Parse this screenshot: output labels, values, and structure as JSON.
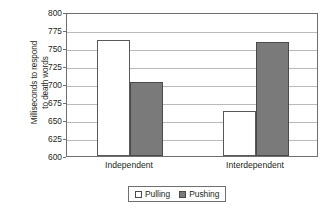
{
  "chart_data": {
    "type": "bar",
    "title": "",
    "xlabel": "",
    "ylabel": "Milliseconds to respond\nto death words",
    "categories": [
      "Independent",
      "Interdependent"
    ],
    "series": [
      {
        "name": "Pulling",
        "values": [
          761,
          662
        ],
        "color": "#ffffff"
      },
      {
        "name": "Pushing",
        "values": [
          703,
          759
        ],
        "color": "#7a7a7a"
      }
    ],
    "ylim": [
      600,
      800
    ],
    "ytick_values": [
      600,
      625,
      650,
      675,
      700,
      725,
      750,
      775,
      800
    ],
    "ytick_labels": [
      "600",
      "625",
      "650",
      "675",
      "700",
      "725",
      "750",
      "775",
      "800"
    ],
    "grid": true,
    "legend_position": "bottom"
  },
  "legend": {
    "items": [
      {
        "label": "Pulling",
        "swatch": "white-square-icon"
      },
      {
        "label": "Pushing",
        "swatch": "gray-square-icon"
      }
    ]
  }
}
